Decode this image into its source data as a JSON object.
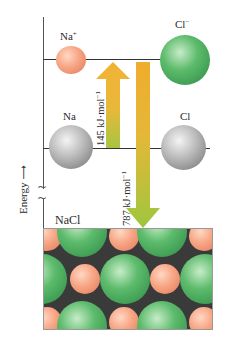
{
  "diagram": {
    "type": "energy-level diagram",
    "axis": {
      "label": "Energy",
      "arrow": "→"
    },
    "levels": [
      {
        "id": "ions",
        "left_species": "Na",
        "left_charge": "+",
        "right_species": "Cl",
        "right_charge": "−"
      },
      {
        "id": "atoms",
        "left_species": "Na",
        "right_species": "Cl"
      },
      {
        "id": "solid",
        "label": "NaCl"
      }
    ],
    "arrows": [
      {
        "direction": "up",
        "label": "145 kJ·mol",
        "exponent": "−1",
        "from": "atoms",
        "to": "ions"
      },
      {
        "direction": "down",
        "label": "787 kJ·mol",
        "exponent": "−1",
        "from": "ions",
        "to": "solid"
      }
    ],
    "colors": {
      "na_ion": "#f4a07f",
      "cl_ion": "#4fae62",
      "neutral_atom": "#a9a9a9",
      "arrow_orange": "#f0b030",
      "arrow_green": "#9cc43a",
      "lattice_bg": "#3a3a3a"
    }
  }
}
